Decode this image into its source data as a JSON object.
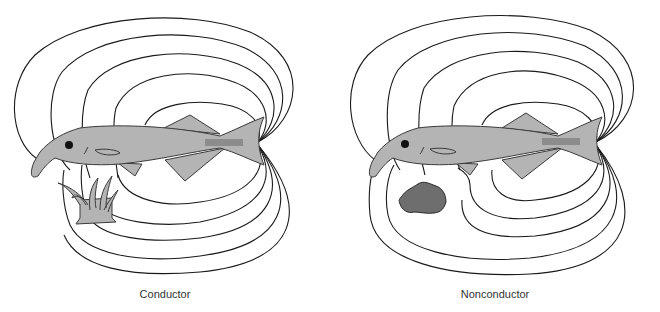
{
  "figure": {
    "panels": [
      {
        "id": "conductor",
        "caption": "Conductor",
        "object": "plant (conductor)",
        "field_behavior": "field lines converge toward the object"
      },
      {
        "id": "nonconductor",
        "caption": "Nonconductor",
        "object": "rock (nonconductor)",
        "field_behavior": "field lines bend away around the object"
      }
    ],
    "colors": {
      "fish": "#b4b4b4",
      "electric_organ": "#8c8c8c",
      "rock": "#6e6e6e",
      "plant": "#b4b4b4",
      "field_lines": "#1a1a1a",
      "caption_text": "#333333"
    }
  }
}
